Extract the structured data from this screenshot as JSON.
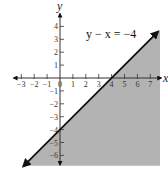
{
  "chart_data": {
    "type": "line",
    "title": "",
    "xlabel": "x",
    "ylabel": "y",
    "equation_label": "y − x = −4",
    "line": {
      "equation": "y = x - 4",
      "slope": 1,
      "intercept": -4,
      "x_intercept": 4,
      "y_intercept": -4
    },
    "shaded_region": "below the line (y - x <= -4)",
    "xlim": [
      -3.5,
      7.8
    ],
    "ylim": [
      -6.8,
      5
    ],
    "x_ticks": [
      -3,
      -2,
      -1,
      0,
      1,
      2,
      3,
      4,
      5,
      6,
      7
    ],
    "y_ticks": [
      -6,
      -5,
      -4,
      -3,
      -2,
      -1,
      1,
      2,
      3,
      4
    ],
    "x_tick_labels": [
      "−3",
      "−2",
      "−1",
      "0",
      "1",
      "2",
      "3",
      "4",
      "5",
      "6",
      "7"
    ],
    "y_tick_labels": [
      "−6",
      "−5",
      "−4",
      "−3",
      "−2",
      "−1",
      "1",
      "2",
      "3",
      "4"
    ],
    "grid": false,
    "colors": {
      "shade": "#b3b3b3",
      "line": "#111111",
      "axes": "#333333"
    }
  }
}
